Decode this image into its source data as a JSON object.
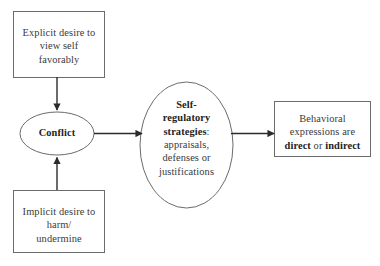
{
  "diagram": {
    "type": "flowchart",
    "background_color": "#ffffff",
    "stroke_color": "#6b6b6b",
    "arrow_color": "#2b2b2b",
    "text_color": "#3a3a3a",
    "nodes": [
      {
        "id": "explicit",
        "shape": "rectangle",
        "name": "explicit-desire-box",
        "lines": [
          "Explicit desire to",
          "view self",
          "favorably"
        ],
        "bold_parts": []
      },
      {
        "id": "implicit",
        "shape": "rectangle",
        "name": "implicit-desire-box",
        "lines": [
          "Implicit desire to",
          "harm/",
          "undermine"
        ],
        "bold_parts": []
      },
      {
        "id": "conflict",
        "shape": "ellipse",
        "name": "conflict-ellipse",
        "lines": [
          "Conflict"
        ],
        "bold_parts": [
          "Conflict"
        ]
      },
      {
        "id": "strategies",
        "shape": "ellipse",
        "name": "self-regulatory-strategies-ellipse",
        "lines": [
          "Self-",
          "regulatory",
          "strategies:",
          "appraisals,",
          "defenses or",
          "justifications"
        ],
        "bold_parts": [
          "Self-",
          "regulatory",
          "strategies"
        ]
      },
      {
        "id": "behavioral",
        "shape": "rectangle",
        "name": "behavioral-expressions-box",
        "lines": [
          "Behavioral",
          "expressions are",
          "direct or indirect"
        ],
        "bold_parts": [
          "direct",
          "indirect"
        ]
      }
    ],
    "edges": [
      {
        "name": "edge-explicit-to-conflict",
        "from": "explicit",
        "to": "conflict",
        "direction": "down",
        "arrowhead": true
      },
      {
        "name": "edge-implicit-to-conflict",
        "from": "implicit",
        "to": "conflict",
        "direction": "up",
        "arrowhead": true
      },
      {
        "name": "edge-conflict-to-strategies",
        "from": "conflict",
        "to": "strategies",
        "direction": "right",
        "arrowhead": true
      },
      {
        "name": "edge-strategies-to-behavioral",
        "from": "strategies",
        "to": "behavioral",
        "direction": "right",
        "arrowhead": true
      }
    ]
  },
  "text": {
    "explicit": {
      "line1": "Explicit desire to",
      "line2": "view self",
      "line3": "favorably"
    },
    "implicit": {
      "line1": "Implicit desire to",
      "line2": "harm/",
      "line3": "undermine"
    },
    "conflict": {
      "label": "Conflict"
    },
    "strategies": {
      "line1": "Self-",
      "line2": "regulatory",
      "line3_bold": "strategies",
      "line3_tail": ":",
      "line4": "appraisals,",
      "line5": "defenses or",
      "line6": "justifications"
    },
    "behavioral": {
      "line1": "Behavioral",
      "line2": "expressions are",
      "line3_bold_a": "direct",
      "line3_mid": " or ",
      "line3_bold_b": "indirect"
    }
  }
}
